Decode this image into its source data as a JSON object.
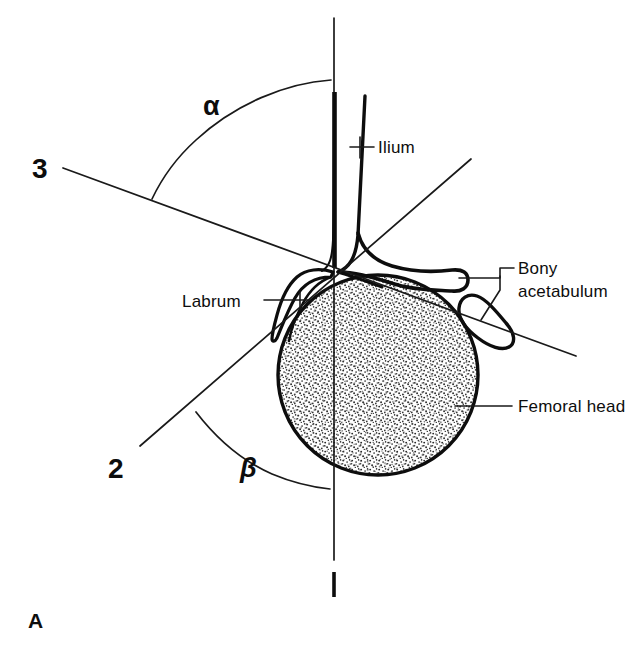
{
  "figure": {
    "panel_label": "A",
    "background_color": "#ffffff",
    "ink_color": "#0d0d0d"
  },
  "reference_lines": [
    {
      "id": "line-1",
      "label": "1",
      "name": "baseline",
      "description": "vertical baseline along the lateral ilium"
    },
    {
      "id": "line-2",
      "label": "2",
      "name": "cartilage-roof-line",
      "description": "line from lower left through the acetabular apex to upper right"
    },
    {
      "id": "line-3",
      "label": "3",
      "name": "bony-roof-line",
      "description": "line from upper left through the acetabular apex to lower right"
    }
  ],
  "angles": [
    {
      "id": "alpha",
      "symbol": "α",
      "name": "alpha-angle",
      "between": [
        "1",
        "3"
      ]
    },
    {
      "id": "beta",
      "symbol": "β",
      "name": "beta-angle",
      "between": [
        "1",
        "2"
      ]
    }
  ],
  "anatomy_labels": [
    {
      "id": "ilium",
      "text": "Ilium"
    },
    {
      "id": "bony-acetabulum",
      "text": "Bony\nacetabulum",
      "line_1": "Bony",
      "line_2": "acetabulum"
    },
    {
      "id": "labrum",
      "text": "Labrum"
    },
    {
      "id": "femoral-head",
      "text": "Femoral head"
    }
  ],
  "structures": [
    {
      "id": "femoral-head-circle",
      "name": "femoral head",
      "fill": "stipple",
      "center_x": 378,
      "center_y": 375,
      "radius": 100
    },
    {
      "id": "ilium-outline",
      "name": "ilium"
    },
    {
      "id": "labrum-outline",
      "name": "labrum"
    },
    {
      "id": "acetabular-roof",
      "name": "bony acetabular roof"
    },
    {
      "id": "acetabular-ossicle",
      "name": "bony acetabulum ossicle"
    }
  ]
}
